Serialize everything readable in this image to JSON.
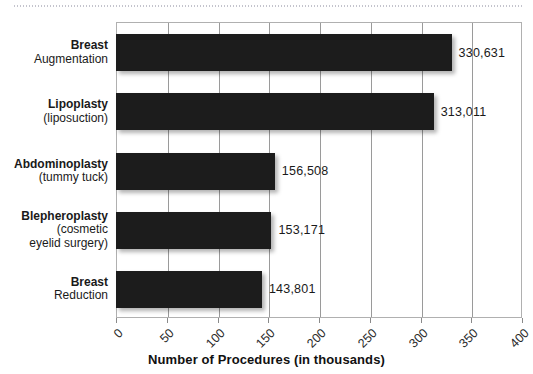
{
  "chart_data": {
    "type": "bar",
    "orientation": "horizontal",
    "title": "",
    "xlabel": "Number of Procedures (in thousands)",
    "ylabel": "",
    "categories": [
      "Breast Augmentation",
      "Lipoplasty (liposuction)",
      "Abdominoplasty (tummy tuck)",
      "Blepheroplasty (cosmetic eyelid surgery)",
      "Breast Reduction"
    ],
    "category_lines": [
      [
        "Breast",
        "Augmentation"
      ],
      [
        "Lipoplasty",
        "(liposuction)"
      ],
      [
        "Abdominoplasty",
        "(tummy tuck)"
      ],
      [
        "Blepheroplasty",
        "(cosmetic",
        "eyelid surgery)"
      ],
      [
        "Breast",
        "Reduction"
      ]
    ],
    "values": [
      330.631,
      313.011,
      156.508,
      153.171,
      143.801
    ],
    "value_labels": [
      "330,631",
      "313,011",
      "156,508",
      "153,171",
      "143,801"
    ],
    "xticks": [
      0,
      50,
      100,
      150,
      200,
      250,
      300,
      350,
      400
    ],
    "xtick_labels": [
      "0",
      "50",
      "100",
      "150",
      "200",
      "250",
      "300",
      "350",
      "400"
    ],
    "xlim": [
      0,
      400
    ],
    "grid": true,
    "grid_axis": "x",
    "legend": false,
    "bar_color": "#1c1c1c",
    "grid_color": "#9a9a9a",
    "frame_color": "#b0b0b0",
    "text_color": "#1a1a1a"
  }
}
